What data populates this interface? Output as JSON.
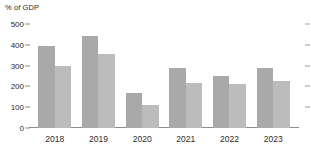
{
  "chart_data": {
    "type": "bar",
    "title": "",
    "subtitle": "",
    "xlabel": "",
    "ylabel": "% of GDP",
    "categories": [
      "2018",
      "2019",
      "2020",
      "2021",
      "2022",
      "2023"
    ],
    "series": [
      {
        "name": "series-1",
        "color": "#a9a9a9",
        "values": [
          395,
          440,
          170,
          290,
          250,
          290
        ]
      },
      {
        "name": "series-2",
        "color": "#bcbcbc",
        "values": [
          298,
          355,
          113,
          218,
          212,
          225
        ]
      }
    ],
    "ylim": [
      0,
      500
    ],
    "yticks": [
      0,
      100,
      200,
      300,
      400,
      500
    ],
    "ytick_labels": [
      "0",
      "100",
      "200",
      "300",
      "400",
      "500"
    ],
    "grid": false,
    "legend": "none",
    "right_axis_ticks": true,
    "right_axis_tick_labels": []
  }
}
